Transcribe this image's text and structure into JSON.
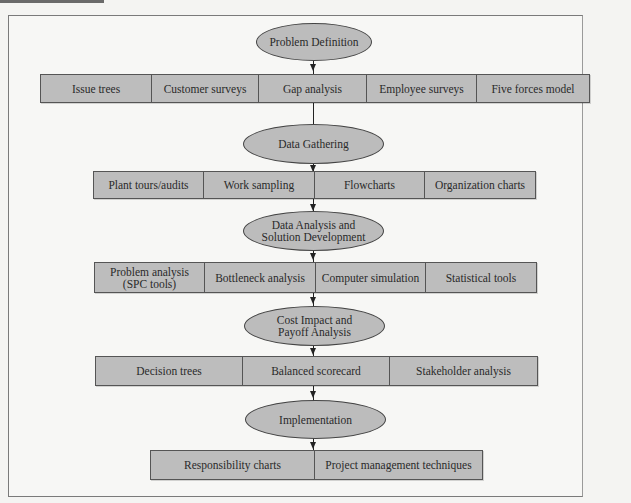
{
  "diagram": {
    "type": "flowchart",
    "stages": [
      {
        "label": "Problem Definition",
        "tools": [
          "Issue trees",
          "Customer surveys",
          "Gap analysis",
          "Employee surveys",
          "Five forces model"
        ]
      },
      {
        "label": "Data Gathering",
        "tools": [
          "Plant tours/audits",
          "Work sampling",
          "Flowcharts",
          "Organization charts"
        ]
      },
      {
        "label": "Data Analysis and Solution Development",
        "label_lines": [
          "Data Analysis and",
          "Solution Development"
        ],
        "tools": [
          "Problem analysis (SPC tools)",
          "Bottleneck analysis",
          "Computer simulation",
          "Statistical tools"
        ],
        "tool_lines": [
          [
            "Problem analysis",
            "(SPC tools)"
          ]
        ]
      },
      {
        "label": "Cost Impact and Payoff Analysis",
        "label_lines": [
          "Cost Impact and",
          "Payoff Analysis"
        ],
        "tools": [
          "Decision trees",
          "Balanced scorecard",
          "Stakeholder analysis"
        ]
      },
      {
        "label": "Implementation",
        "tools": [
          "Responsibility charts",
          "Project management techniques"
        ]
      }
    ],
    "colors": {
      "shape_fill": "#bcbcbc",
      "outline": "#444444",
      "background": "#f7f7f5"
    }
  }
}
